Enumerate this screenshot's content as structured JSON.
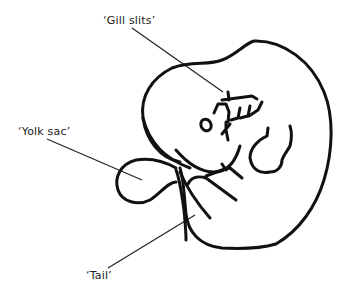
{
  "diagram": {
    "labels": [
      {
        "id": "gill-slits",
        "text": "‘Gill slits’",
        "x": 103,
        "y": 14
      },
      {
        "id": "yolk-sac",
        "text": "‘Yolk sac’",
        "x": 18,
        "y": 125
      },
      {
        "id": "tail",
        "text": "‘Tail’",
        "x": 86,
        "y": 269
      }
    ],
    "colors": {
      "outline": "#111111",
      "leader": "#222222",
      "background": "#ffffff"
    }
  }
}
